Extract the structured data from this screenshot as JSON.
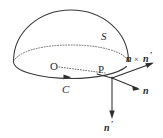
{
  "figure": {
    "type": "geometry-diagram",
    "background_color": "#ffffff",
    "line_color": "#3a3a3a",
    "dotted_line_color": "#6a6a6a",
    "text_color": "#2b2b2b",
    "labels": {
      "surface": "S",
      "centre": "O",
      "point": "P",
      "curve": "C",
      "vector_cross": "n",
      "vector_cross_op": "×",
      "vector_cross_second": "n",
      "vector_cross_second_prime": "′",
      "vector_normal": "n",
      "vector_prime": "n",
      "vector_prime_mark": "′"
    },
    "elements": {
      "dome_label": "hemisphere-outline",
      "equator_back_label": "equator-back-dotted-arc",
      "rim_front_label": "boundary-curve-C",
      "radius_label": "radius-OP-dotted",
      "curve_arrow_label": "curve-direction-arrow"
    }
  }
}
